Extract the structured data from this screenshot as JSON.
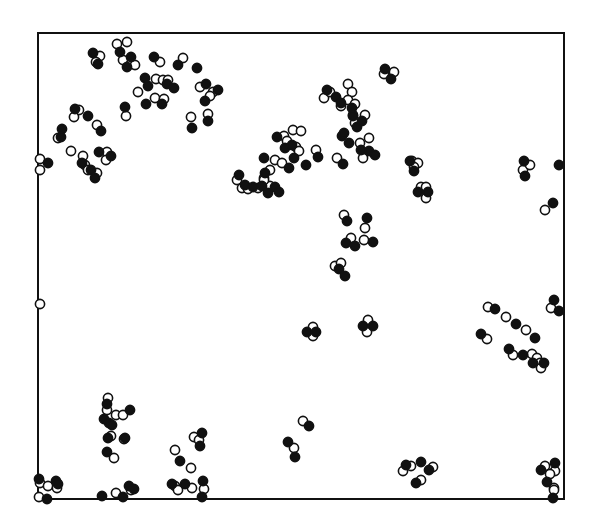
{
  "chart_data": {
    "type": "scatter",
    "title": "",
    "xlabel": "",
    "ylabel": "",
    "grid": false,
    "legend": null,
    "frame": {
      "left": 38,
      "top": 33,
      "right": 564,
      "bottom": 499,
      "stroke": "#111111",
      "stroke_width": 2
    },
    "marker_radius": 4.6,
    "series": [
      {
        "name": "filled",
        "fill": "#111111",
        "stroke": "#111111",
        "points": [
          [
            93,
            53
          ],
          [
            120,
            52
          ],
          [
            131,
            57
          ],
          [
            98,
            64
          ],
          [
            127,
            67
          ],
          [
            154,
            57
          ],
          [
            145,
            78
          ],
          [
            148,
            86
          ],
          [
            167,
            84
          ],
          [
            174,
            88
          ],
          [
            162,
            104
          ],
          [
            146,
            104
          ],
          [
            178,
            65
          ],
          [
            197,
            68
          ],
          [
            206,
            84
          ],
          [
            218,
            90
          ],
          [
            205,
            101
          ],
          [
            125,
            107
          ],
          [
            192,
            128
          ],
          [
            208,
            121
          ],
          [
            75,
            109
          ],
          [
            88,
            116
          ],
          [
            62,
            129
          ],
          [
            61,
            137
          ],
          [
            101,
            131
          ],
          [
            99,
            152
          ],
          [
            82,
            163
          ],
          [
            91,
            170
          ],
          [
            111,
            156
          ],
          [
            48,
            163
          ],
          [
            95,
            178
          ],
          [
            239,
            175
          ],
          [
            245,
            185
          ],
          [
            253,
            187
          ],
          [
            262,
            186
          ],
          [
            264,
            158
          ],
          [
            268,
            193
          ],
          [
            277,
            137
          ],
          [
            285,
            148
          ],
          [
            292,
            145
          ],
          [
            294,
            158
          ],
          [
            318,
            157
          ],
          [
            306,
            165
          ],
          [
            289,
            168
          ],
          [
            265,
            173
          ],
          [
            275,
            187
          ],
          [
            279,
            192
          ],
          [
            327,
            90
          ],
          [
            336,
            97
          ],
          [
            341,
            103
          ],
          [
            342,
            136
          ],
          [
            344,
            133
          ],
          [
            352,
            108
          ],
          [
            353,
            116
          ],
          [
            357,
            127
          ],
          [
            349,
            143
          ],
          [
            362,
            121
          ],
          [
            369,
            151
          ],
          [
            361,
            150
          ],
          [
            375,
            155
          ],
          [
            385,
            69
          ],
          [
            391,
            79
          ],
          [
            343,
            164
          ],
          [
            410,
            161
          ],
          [
            414,
            171
          ],
          [
            418,
            192
          ],
          [
            428,
            192
          ],
          [
            524,
            161
          ],
          [
            525,
            176
          ],
          [
            559,
            165
          ],
          [
            553,
            203
          ],
          [
            346,
            243
          ],
          [
            347,
            221
          ],
          [
            355,
            246
          ],
          [
            367,
            218
          ],
          [
            373,
            242
          ],
          [
            339,
            269
          ],
          [
            345,
            276
          ],
          [
            307,
            332
          ],
          [
            316,
            332
          ],
          [
            363,
            326
          ],
          [
            373,
            326
          ],
          [
            495,
            309
          ],
          [
            481,
            334
          ],
          [
            516,
            324
          ],
          [
            535,
            338
          ],
          [
            509,
            349
          ],
          [
            523,
            355
          ],
          [
            533,
            363
          ],
          [
            544,
            363
          ],
          [
            554,
            300
          ],
          [
            559,
            311
          ],
          [
            107,
            404
          ],
          [
            130,
            410
          ],
          [
            104,
            419
          ],
          [
            109,
            423
          ],
          [
            112,
            425
          ],
          [
            125,
            438
          ],
          [
            107,
            452
          ],
          [
            108,
            438
          ],
          [
            129,
            486
          ],
          [
            134,
            489
          ],
          [
            102,
            496
          ],
          [
            123,
            497
          ],
          [
            202,
            433
          ],
          [
            200,
            446
          ],
          [
            180,
            461
          ],
          [
            172,
            484
          ],
          [
            185,
            484
          ],
          [
            203,
            481
          ],
          [
            202,
            497
          ],
          [
            56,
            481
          ],
          [
            58,
            484
          ],
          [
            39,
            479
          ],
          [
            47,
            499
          ],
          [
            309,
            426
          ],
          [
            288,
            442
          ],
          [
            295,
            457
          ],
          [
            406,
            465
          ],
          [
            421,
            462
          ],
          [
            429,
            470
          ],
          [
            416,
            483
          ],
          [
            541,
            470
          ],
          [
            555,
            463
          ],
          [
            547,
            482
          ],
          [
            553,
            498
          ]
        ]
      },
      {
        "name": "open",
        "fill": "#ffffff",
        "stroke": "#111111",
        "points": [
          [
            100,
            56
          ],
          [
            96,
            62
          ],
          [
            117,
            44
          ],
          [
            127,
            42
          ],
          [
            123,
            60
          ],
          [
            131,
            64
          ],
          [
            135,
            65
          ],
          [
            160,
            62
          ],
          [
            183,
            58
          ],
          [
            156,
            79
          ],
          [
            163,
            80
          ],
          [
            168,
            80
          ],
          [
            138,
            92
          ],
          [
            155,
            98
          ],
          [
            164,
            99
          ],
          [
            191,
            117
          ],
          [
            208,
            114
          ],
          [
            126,
            116
          ],
          [
            200,
            87
          ],
          [
            213,
            92
          ],
          [
            210,
            96
          ],
          [
            79,
            110
          ],
          [
            74,
            117
          ],
          [
            97,
            125
          ],
          [
            58,
            138
          ],
          [
            71,
            151
          ],
          [
            83,
            156
          ],
          [
            107,
            152
          ],
          [
            85,
            165
          ],
          [
            88,
            170
          ],
          [
            97,
            173
          ],
          [
            40,
            159
          ],
          [
            40,
            170
          ],
          [
            106,
            160
          ],
          [
            237,
            180
          ],
          [
            242,
            188
          ],
          [
            248,
            189
          ],
          [
            258,
            188
          ],
          [
            270,
            186
          ],
          [
            264,
            178
          ],
          [
            284,
            136
          ],
          [
            293,
            130
          ],
          [
            301,
            131
          ],
          [
            287,
            141
          ],
          [
            296,
            147
          ],
          [
            299,
            151
          ],
          [
            316,
            150
          ],
          [
            275,
            160
          ],
          [
            282,
            163
          ],
          [
            270,
            170
          ],
          [
            264,
            180
          ],
          [
            337,
            158
          ],
          [
            324,
            98
          ],
          [
            330,
            92
          ],
          [
            348,
            84
          ],
          [
            352,
            92
          ],
          [
            341,
            106
          ],
          [
            348,
            100
          ],
          [
            355,
            104
          ],
          [
            353,
            115
          ],
          [
            365,
            115
          ],
          [
            355,
            123
          ],
          [
            360,
            143
          ],
          [
            369,
            138
          ],
          [
            363,
            158
          ],
          [
            384,
            74
          ],
          [
            394,
            72
          ],
          [
            412,
            161
          ],
          [
            418,
            163
          ],
          [
            414,
            167
          ],
          [
            421,
            187
          ],
          [
            426,
            187
          ],
          [
            426,
            198
          ],
          [
            523,
            170
          ],
          [
            530,
            165
          ],
          [
            545,
            210
          ],
          [
            344,
            215
          ],
          [
            351,
            238
          ],
          [
            365,
            228
          ],
          [
            364,
            240
          ],
          [
            335,
            266
          ],
          [
            341,
            263
          ],
          [
            313,
            327
          ],
          [
            313,
            336
          ],
          [
            368,
            320
          ],
          [
            367,
            332
          ],
          [
            488,
            307
          ],
          [
            487,
            339
          ],
          [
            506,
            317
          ],
          [
            526,
            330
          ],
          [
            513,
            355
          ],
          [
            532,
            354
          ],
          [
            537,
            358
          ],
          [
            540,
            363
          ],
          [
            541,
            368
          ],
          [
            551,
            308
          ],
          [
            108,
            398
          ],
          [
            107,
            410
          ],
          [
            116,
            415
          ],
          [
            123,
            415
          ],
          [
            111,
            436
          ],
          [
            114,
            458
          ],
          [
            124,
            439
          ],
          [
            40,
            483
          ],
          [
            48,
            486
          ],
          [
            57,
            488
          ],
          [
            116,
            493
          ],
          [
            131,
            490
          ],
          [
            175,
            450
          ],
          [
            194,
            437
          ],
          [
            199,
            440
          ],
          [
            191,
            468
          ],
          [
            175,
            486
          ],
          [
            178,
            490
          ],
          [
            192,
            488
          ],
          [
            204,
            489
          ],
          [
            39,
            497
          ],
          [
            303,
            421
          ],
          [
            294,
            448
          ],
          [
            403,
            471
          ],
          [
            411,
            466
          ],
          [
            421,
            480
          ],
          [
            433,
            467
          ],
          [
            545,
            466
          ],
          [
            555,
            471
          ],
          [
            550,
            474
          ],
          [
            554,
            488
          ],
          [
            554,
            490
          ],
          [
            40,
            304
          ]
        ]
      }
    ]
  }
}
